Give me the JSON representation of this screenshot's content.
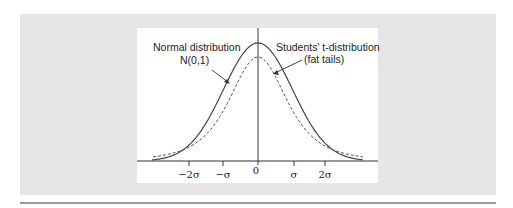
{
  "chart_data": {
    "type": "line",
    "title": "",
    "xlabel": "",
    "ylabel": "",
    "x_ticks": [
      "−2σ",
      "−σ",
      "0",
      "σ",
      "2σ"
    ],
    "x_tick_values": [
      -2,
      -1,
      0,
      1,
      2
    ],
    "xlim": [
      -3.1,
      3.1
    ],
    "grid": false,
    "legend": "none",
    "series": [
      {
        "name": "Normal distribution N(0,1)",
        "style": "solid",
        "peak": 0.399,
        "description": "standard normal density"
      },
      {
        "name": "Students' t-distribution (fat tails)",
        "style": "dashed",
        "peak": 0.35,
        "description": "t-distribution with heavier tails, lower peak"
      }
    ],
    "annotations": [
      {
        "text": "Normal distribution",
        "line2": "N(0,1)",
        "points_to": "solid curve, left flank"
      },
      {
        "text": "Students' t-distribution",
        "line2": "(fat tails)",
        "points_to": "dashed curve, right flank"
      }
    ]
  },
  "labels": {
    "normal_line1": "Normal distribution",
    "normal_line2": "N(0,1)",
    "t_line1": "Students' t-distribution",
    "t_line2": "(fat tails)",
    "tick_m2": "−2σ",
    "tick_m1": "−σ",
    "tick_0": "0",
    "tick_p1": "σ",
    "tick_p2": "2σ"
  },
  "colors": {
    "panel": "#e6e6e6",
    "plot_bg": "#ffffff",
    "curve": "#444444",
    "rule": "#9a9a9a"
  }
}
